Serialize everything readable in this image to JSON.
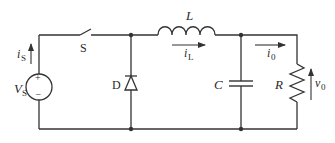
{
  "diagram": {
    "type": "buck-converter-circuit",
    "components": {
      "source": {
        "label": "V",
        "subscript": "S",
        "plus": "+",
        "minus": "−"
      },
      "switch": {
        "label": "S"
      },
      "diode": {
        "label": "D"
      },
      "inductor": {
        "label": "L"
      },
      "capacitor": {
        "label": "C"
      },
      "resistor": {
        "label": "R"
      }
    },
    "currents": {
      "source_current": {
        "label": "i",
        "subscript": "S"
      },
      "inductor_current": {
        "label": "i",
        "subscript": "L"
      },
      "output_current": {
        "label": "i",
        "subscript": "0"
      }
    },
    "voltages": {
      "output_voltage": {
        "label": "v",
        "subscript": "0"
      }
    },
    "colors": {
      "line": "#333333",
      "background": "#ffffff"
    }
  }
}
